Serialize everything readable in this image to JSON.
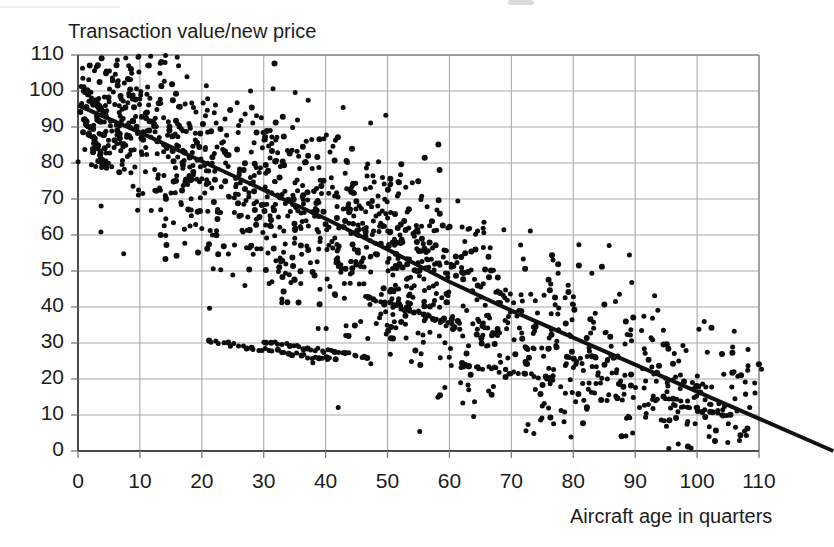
{
  "chart_data": {
    "type": "scatter",
    "title": "",
    "xlabel": "Aircraft age in quarters",
    "ylabel": "Transaction value/new price",
    "xlim": [
      0,
      110
    ],
    "ylim": [
      0,
      110
    ],
    "xticks": [
      0,
      10,
      20,
      30,
      40,
      50,
      60,
      70,
      80,
      90,
      100,
      110
    ],
    "yticks": [
      0,
      10,
      20,
      30,
      40,
      50,
      60,
      70,
      80,
      90,
      100,
      110
    ],
    "xtick_labels": [
      "0",
      "10",
      "20",
      "30",
      "40",
      "50",
      "60",
      "70",
      "80",
      "90",
      "100",
      "110"
    ],
    "ytick_labels": [
      "0",
      "10",
      "20",
      "30",
      "40",
      "50",
      "60",
      "70",
      "80",
      "90",
      "100",
      "110"
    ],
    "grid": true,
    "grid_color": "#a9a9a9",
    "axis_color": "#555555",
    "marker_color": "#0d0d0d",
    "marker_size": 5,
    "legend": null,
    "series": [
      {
        "name": "Transactions",
        "type": "scatter",
        "n_points": 1450,
        "description": "Dense downward-sloping cloud of aircraft transaction observations; heaviest concentration at low age / high value, dispersing and declining with age.",
        "point_count_note": "Individual points generated from the density model below to match the scanned figure.",
        "density_model": {
          "x_range": [
            0,
            112
          ],
          "y_at_x0": 96,
          "decay": "near-linear decline of about 0.87 value points per quarter with increasing vertical spread",
          "spread_at_x0": 11,
          "spread_at_x110": 13,
          "x_density_weights": [
            {
              "x": 0,
              "w": 0.55
            },
            {
              "x": 5,
              "w": 1.0
            },
            {
              "x": 12,
              "w": 0.8
            },
            {
              "x": 18,
              "w": 0.86
            },
            {
              "x": 25,
              "w": 0.78
            },
            {
              "x": 32,
              "w": 0.82
            },
            {
              "x": 40,
              "w": 0.8
            },
            {
              "x": 46,
              "w": 0.92
            },
            {
              "x": 52,
              "w": 0.95
            },
            {
              "x": 58,
              "w": 0.8
            },
            {
              "x": 65,
              "w": 0.62
            },
            {
              "x": 72,
              "w": 0.52
            },
            {
              "x": 80,
              "w": 0.46
            },
            {
              "x": 88,
              "w": 0.4
            },
            {
              "x": 95,
              "w": 0.36
            },
            {
              "x": 102,
              "w": 0.34
            },
            {
              "x": 110,
              "w": 0.22
            }
          ]
        }
      },
      {
        "name": "Fitted trend line",
        "type": "line",
        "color": "#111111",
        "width": 4,
        "points": [
          {
            "x": 0,
            "y": 96
          },
          {
            "x": 10,
            "y": 88.5
          },
          {
            "x": 20,
            "y": 80.5
          },
          {
            "x": 30,
            "y": 72.5
          },
          {
            "x": 40,
            "y": 64.5
          },
          {
            "x": 50,
            "y": 56.0
          },
          {
            "x": 60,
            "y": 47.0
          },
          {
            "x": 70,
            "y": 39.0
          },
          {
            "x": 80,
            "y": 31.5
          },
          {
            "x": 90,
            "y": 24.0
          },
          {
            "x": 100,
            "y": 16.5
          },
          {
            "x": 110,
            "y": 9.0
          },
          {
            "x": 122,
            "y": 0.0
          }
        ],
        "extends_past_axis": true
      }
    ]
  },
  "axes": {
    "y_title": "Transaction value/new price",
    "x_title": "Aircraft age in quarters"
  }
}
